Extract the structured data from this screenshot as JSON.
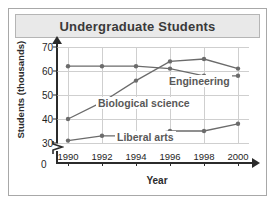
{
  "figure": {
    "title": "Undergraduate Students"
  },
  "chart_data": {
    "type": "line",
    "title": "Undergraduate Students",
    "xlabel": "Year",
    "ylabel": "Students (thousands)",
    "categories": [
      "1990",
      "1992",
      "1994",
      "1996",
      "1998",
      "2000"
    ],
    "x": [
      1990,
      1992,
      1994,
      1996,
      1998,
      2000
    ],
    "ylim": [
      30,
      70
    ],
    "yticks": [
      "0",
      "30",
      "40",
      "50",
      "60",
      "70"
    ],
    "y_axis_break": true,
    "grid": true,
    "legend": "inline-labels",
    "series": [
      {
        "name": "Engineering",
        "color": "#6b6b6b",
        "values": [
          62,
          62,
          62,
          61,
          58,
          58
        ]
      },
      {
        "name": "Biological science",
        "color": "#6b6b6b",
        "values": [
          40,
          47,
          56,
          64,
          65,
          61
        ]
      },
      {
        "name": "Liberal arts",
        "color": "#6b6b6b",
        "values": [
          31,
          33,
          33,
          35,
          35,
          38
        ]
      }
    ],
    "annotations": [
      {
        "text": "Engineering",
        "near": "1997, 55"
      },
      {
        "text": "Biological science",
        "near": "1994, 46"
      },
      {
        "text": "Liberal arts",
        "near": "1994, 31"
      }
    ]
  },
  "colors": {
    "title_bar_bg": "#e9e9e9",
    "frame_border": "#a8a8a8",
    "grid": "#cfcfcf",
    "axis": "#2b2b2b",
    "series_line": "#6b6b6b",
    "series_label": "#595959"
  }
}
